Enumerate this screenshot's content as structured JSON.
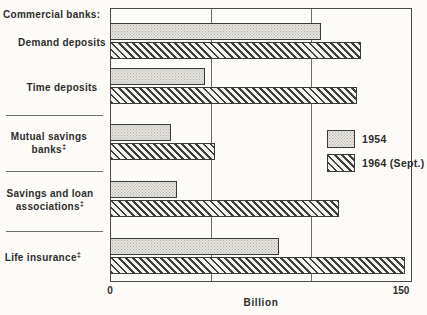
{
  "chart_data": {
    "type": "bar",
    "orientation": "horizontal",
    "group_header": "Commercial banks:",
    "categories": [
      {
        "label": "Demand deposits",
        "lines": [
          "Demand deposits"
        ],
        "footnote": ""
      },
      {
        "label": "Time deposits",
        "lines": [
          "Time deposits"
        ],
        "footnote": ""
      },
      {
        "label": "Mutual savings banks",
        "lines": [
          "Mutual savings",
          "banks"
        ],
        "footnote": "‡"
      },
      {
        "label": "Savings and loan associations",
        "lines": [
          "Savings and loan",
          "associations"
        ],
        "footnote": "‡"
      },
      {
        "label": "Life insurance",
        "lines": [
          "Life insurance"
        ],
        "footnote": "‡"
      }
    ],
    "series": [
      {
        "name": "1954",
        "pattern": "stipple",
        "values": [
          105,
          47,
          30,
          33,
          84
        ]
      },
      {
        "name": "1964 (Sept.)",
        "pattern": "hatch",
        "values": [
          125,
          123,
          52,
          114,
          147
        ]
      }
    ],
    "xlabel": "Billion",
    "xlim": [
      0,
      150
    ],
    "xticks": [
      0,
      50,
      100,
      150
    ],
    "xtick_labels": [
      "0",
      "150"
    ],
    "legend_position": "middle-right",
    "grid": "vertical"
  },
  "colors": {
    "background": "#fcfbf8",
    "text": "#2d2d2d",
    "frame": "#4a4a4a",
    "gridline": "#6e6e6e",
    "bar_1954_fill": "#e6e4df",
    "bar_1954_dot": "#b0aea9",
    "bar_1964_stripe": "#3e3e3e",
    "bar_1964_bg": "#f4f3ef",
    "bar_border": "#3a3a3a"
  }
}
